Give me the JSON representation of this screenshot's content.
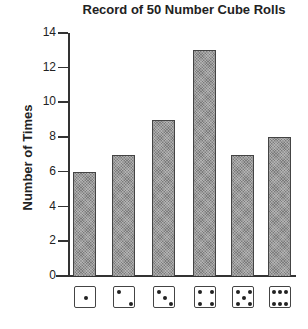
{
  "chart_data": {
    "type": "bar",
    "title": "Record of 50 Number Cube Rolls",
    "xlabel": "",
    "ylabel": "Number of Times",
    "categories": [
      "1",
      "2",
      "3",
      "4",
      "5",
      "6"
    ],
    "category_icons": [
      "die-face-1",
      "die-face-2",
      "die-face-3",
      "die-face-4",
      "die-face-5",
      "die-face-6"
    ],
    "values": [
      6,
      7,
      9,
      13,
      7,
      8
    ],
    "ylim": [
      0,
      14
    ],
    "yticks": [
      "0",
      "2",
      "4",
      "6",
      "8",
      "10",
      "12",
      "14"
    ],
    "grid": false,
    "legend": null,
    "bar_color": "#9a9a9a"
  }
}
